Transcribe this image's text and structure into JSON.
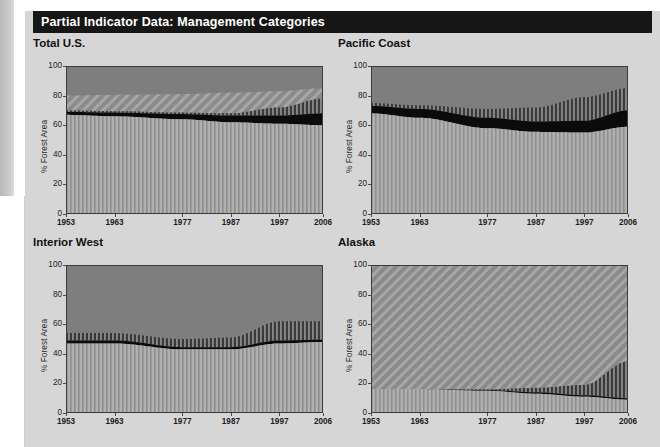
{
  "figure": {
    "title": "Partial Indicator Data: Management Categories",
    "background_color": "#d6d6d6",
    "title_bar_color": "#161616",
    "title_text_color": "#ffffff"
  },
  "axis": {
    "ylabel": "% Forest Area",
    "yticks": [
      "0",
      "20",
      "40",
      "60",
      "80",
      "100"
    ],
    "xticks": [
      "1953",
      "1963",
      "1977",
      "1987",
      "1997",
      "2006"
    ]
  },
  "panels": [
    {
      "title": "Total U.S."
    },
    {
      "title": "Pacific Coast"
    },
    {
      "title": "Interior West"
    },
    {
      "title": "Alaska"
    }
  ],
  "colors": {
    "light_vertical_fill": "#b0b0b0",
    "light_vertical_stripe": "#8f8f8f",
    "black_band": "#0b0b0b",
    "dark_vertical_fill": "#3a3a3a",
    "dark_vertical_stripe": "#9a9a9a",
    "solid_gray": "#7e7e7e",
    "diagonal_gray_fill": "#8a8a8a",
    "diagonal_gray_stripe": "#a6a6a6",
    "plot_border": "#3c3c3c"
  },
  "chart_data": {
    "type": "area",
    "title": "Partial Indicator Data: Management Categories",
    "xlabel": "",
    "ylabel": "% Forest Area",
    "xlim": [
      1953,
      2006
    ],
    "ylim": [
      0,
      100
    ],
    "grid": false,
    "legend_position": "none",
    "stacking": "stacked-to-100",
    "x_tick_labels": [
      "1953",
      "1963",
      "1977",
      "1987",
      "1997",
      "2006"
    ],
    "y_tick_labels": [
      "0",
      "20",
      "40",
      "60",
      "80",
      "100"
    ],
    "series_order": [
      "light-vertical-hatch",
      "black-solid",
      "dark-vertical-hatch",
      "top-fill"
    ],
    "panels": [
      {
        "title": "Total U.S.",
        "top_fill_texture": "solid-gray-with-diagonal-hatch-sub-band",
        "x": [
          1953,
          1963,
          1977,
          1987,
          1997,
          2006
        ],
        "series": [
          {
            "name": "light-vertical-hatch",
            "values": [
              67,
              66,
              64,
              62,
              61,
              60
            ]
          },
          {
            "name": "black-solid",
            "cumulative_top": [
              69,
              68.5,
              67.5,
              66.5,
              66.5,
              68
            ]
          },
          {
            "name": "dark-vertical-hatch",
            "cumulative_top": [
              70,
              69.5,
              68.5,
              68,
              72,
              78
            ]
          },
          {
            "name": "diagonal-hatch-gray",
            "cumulative_top": [
              80,
              80.5,
              81,
              82,
              83,
              85
            ]
          },
          {
            "name": "solid-gray",
            "cumulative_top": [
              100,
              100,
              100,
              100,
              100,
              100
            ]
          }
        ]
      },
      {
        "title": "Pacific Coast",
        "top_fill_texture": "solid-gray",
        "x": [
          1953,
          1963,
          1977,
          1987,
          1997,
          2006
        ],
        "series": [
          {
            "name": "light-vertical-hatch",
            "values": [
              68,
              65,
              58,
              55.5,
              55,
              59
            ]
          },
          {
            "name": "black-solid",
            "cumulative_top": [
              73,
              71,
              65,
              62.5,
              63,
              70
            ]
          },
          {
            "name": "dark-vertical-hatch",
            "cumulative_top": [
              75,
              73.5,
              71,
              72,
              79,
              85
            ]
          },
          {
            "name": "solid-gray",
            "cumulative_top": [
              100,
              100,
              100,
              100,
              100,
              100
            ]
          }
        ]
      },
      {
        "title": "Interior West",
        "top_fill_texture": "solid-gray",
        "x": [
          1953,
          1963,
          1977,
          1987,
          1997,
          2006
        ],
        "series": [
          {
            "name": "light-vertical-hatch",
            "values": [
              47,
              47,
              43,
              43,
              47,
              48
            ]
          },
          {
            "name": "black-solid",
            "cumulative_top": [
              49,
              49,
              44.5,
              44.5,
              49,
              49.5
            ]
          },
          {
            "name": "dark-vertical-hatch",
            "cumulative_top": [
              54,
              54,
              50,
              51,
              62,
              62
            ]
          },
          {
            "name": "solid-gray",
            "cumulative_top": [
              100,
              100,
              100,
              100,
              100,
              100
            ]
          }
        ]
      },
      {
        "title": "Alaska",
        "top_fill_texture": "diagonal-hatch-gray",
        "x": [
          1953,
          1963,
          1977,
          1987,
          1997,
          2006
        ],
        "series": [
          {
            "name": "light-vertical-hatch",
            "values": [
              16,
              16,
              15,
              13,
              11,
              9
            ]
          },
          {
            "name": "black-solid",
            "cumulative_top": [
              16,
              16,
              15.5,
              14,
              12,
              10
            ]
          },
          {
            "name": "dark-vertical-hatch",
            "cumulative_top": [
              16,
              16,
              16,
              17,
              19,
              35
            ]
          },
          {
            "name": "diagonal-hatch-gray",
            "cumulative_top": [
              100,
              100,
              100,
              100,
              100,
              100
            ]
          }
        ]
      }
    ]
  }
}
